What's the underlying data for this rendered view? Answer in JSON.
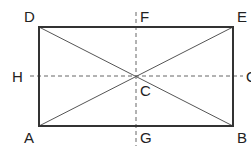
{
  "diagram": {
    "type": "rectangle-with-diagonals-and-midlines",
    "colors": {
      "stroke": "#333333",
      "dashed": "#666666",
      "diagonal": "#555555",
      "label": "#222222"
    },
    "points": {
      "A": {
        "label": "A",
        "x": 39,
        "y": 126
      },
      "B": {
        "label": "B",
        "x": 233,
        "y": 126
      },
      "E": {
        "label": "E",
        "x": 233,
        "y": 27
      },
      "D": {
        "label": "D",
        "x": 39,
        "y": 27
      },
      "C": {
        "label": "C",
        "x": 136,
        "y": 76
      },
      "F": {
        "label": "F",
        "x": 136,
        "y": 27
      },
      "G": {
        "label": "G",
        "x": 136,
        "y": 126
      },
      "H": {
        "label": "H",
        "x": 39,
        "y": 76
      },
      "I": {
        "label": "O",
        "x": 233,
        "y": 76
      }
    },
    "segments": [
      {
        "from": "A",
        "to": "B",
        "style": "solid"
      },
      {
        "from": "B",
        "to": "E",
        "style": "solid"
      },
      {
        "from": "E",
        "to": "D",
        "style": "solid"
      },
      {
        "from": "D",
        "to": "A",
        "style": "solid"
      },
      {
        "from": "A",
        "to": "E",
        "style": "thin"
      },
      {
        "from": "D",
        "to": "B",
        "style": "thin"
      },
      {
        "from": "F",
        "to": "G",
        "style": "dashed"
      },
      {
        "from": "H",
        "to": "I",
        "style": "dashed"
      }
    ]
  }
}
